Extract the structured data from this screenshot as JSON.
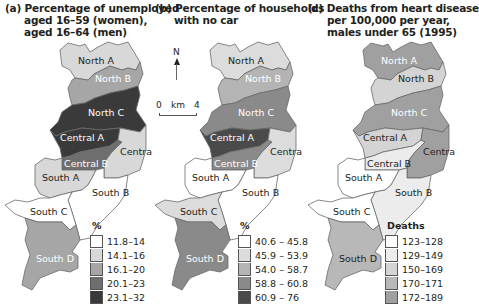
{
  "panels": [
    {
      "id": "a",
      "title": [
        "(a) Percentage of unemployed",
        "aged 16–59 (women),",
        "aged 16–64 (men)"
      ],
      "legend": {
        "heading": "%",
        "classes": [
          {
            "label": "11.8–14",
            "color": "#ffffff"
          },
          {
            "label": "14.1–16",
            "color": "#d8d8d8"
          },
          {
            "label": "16.1–20",
            "color": "#a6a6a6"
          },
          {
            "label": "20.1–23",
            "color": "#6e6e6e"
          },
          {
            "label": "23.1–32",
            "color": "#3a3a3a"
          }
        ]
      },
      "regions": {
        "north_a": {
          "name": "North A",
          "class": 1,
          "label_color": "#231f20"
        },
        "north_b": {
          "name": "North B",
          "class": 2,
          "label_color": "#ffffff"
        },
        "north_c": {
          "name": "North C",
          "class": 4,
          "label_color": "#ffffff"
        },
        "central_a": {
          "name": "Central A",
          "class": 4,
          "label_color": "#ffffff"
        },
        "central_b": {
          "name": "Central B",
          "class": 3,
          "label_color": "#ffffff"
        },
        "central_c": {
          "name": "Central C",
          "class": 1,
          "label_color": "#231f20"
        },
        "south_a": {
          "name": "South A",
          "class": 1,
          "label_color": "#231f20"
        },
        "south_b": {
          "name": "South B",
          "class": 0,
          "label_color": "#231f20"
        },
        "south_c": {
          "name": "South C",
          "class": 0,
          "label_color": "#231f20"
        },
        "south_d": {
          "name": "South D",
          "class": 2,
          "label_color": "#ffffff"
        }
      }
    },
    {
      "id": "b",
      "title": [
        "(b) Percentage of households",
        "with no car"
      ],
      "legend": {
        "heading": "%",
        "classes": [
          {
            "label": "40.6 – 45.8",
            "color": "#ffffff"
          },
          {
            "label": "45.9 – 53.9",
            "color": "#dcdcdc"
          },
          {
            "label": "54.0 – 58.7",
            "color": "#b4b4b4"
          },
          {
            "label": "58.8 – 60.8",
            "color": "#8a8a8a"
          },
          {
            "label": "60.9 – 76",
            "color": "#4a4a4a"
          }
        ]
      },
      "regions": {
        "north_a": {
          "name": "North A",
          "class": 1,
          "label_color": "#231f20"
        },
        "north_b": {
          "name": "North B",
          "class": 2,
          "label_color": "#ffffff"
        },
        "north_c": {
          "name": "North C",
          "class": 3,
          "label_color": "#ffffff"
        },
        "central_a": {
          "name": "Central A",
          "class": 4,
          "label_color": "#ffffff"
        },
        "central_b": {
          "name": "Central B",
          "class": 3,
          "label_color": "#ffffff"
        },
        "central_c": {
          "name": "Central C",
          "class": 1,
          "label_color": "#231f20"
        },
        "south_a": {
          "name": "South A",
          "class": 0,
          "label_color": "#231f20"
        },
        "south_b": {
          "name": "South B",
          "class": 0,
          "label_color": "#231f20"
        },
        "south_c": {
          "name": "South C",
          "class": 1,
          "label_color": "#231f20"
        },
        "south_d": {
          "name": "South D",
          "class": 3,
          "label_color": "#ffffff"
        }
      }
    },
    {
      "id": "c",
      "title": [
        "(c) Deaths from heart disease",
        "per 100,000 per year,",
        "males under 65 (1995)"
      ],
      "legend": {
        "heading": "Deaths",
        "classes": [
          {
            "label": "123–128",
            "color": "#ffffff"
          },
          {
            "label": "129–149",
            "color": "#ececec"
          },
          {
            "label": "150–169",
            "color": "#d4d4d4"
          },
          {
            "label": "170–171",
            "color": "#b8b8b8"
          },
          {
            "label": "172–189",
            "color": "#a0a0a0"
          }
        ]
      },
      "regions": {
        "north_a": {
          "name": "North A",
          "class": 4,
          "label_color": "#ffffff"
        },
        "north_b": {
          "name": "North B",
          "class": 2,
          "label_color": "#231f20"
        },
        "north_c": {
          "name": "North C",
          "class": 4,
          "label_color": "#ffffff"
        },
        "central_a": {
          "name": "Central A",
          "class": 2,
          "label_color": "#231f20"
        },
        "central_b": {
          "name": "Central B",
          "class": 1,
          "label_color": "#231f20"
        },
        "central_c": {
          "name": "Central C",
          "class": 4,
          "label_color": "#231f20"
        },
        "south_a": {
          "name": "South A",
          "class": 0,
          "label_color": "#231f20"
        },
        "south_b": {
          "name": "South B",
          "class": 1,
          "label_color": "#231f20"
        },
        "south_c": {
          "name": "South C",
          "class": 0,
          "label_color": "#231f20"
        },
        "south_d": {
          "name": "South D",
          "class": 3,
          "label_color": "#231f20"
        }
      }
    }
  ],
  "compass": {
    "north_label": "N"
  },
  "scale": {
    "start": "0",
    "unit": "km",
    "end": "4"
  }
}
